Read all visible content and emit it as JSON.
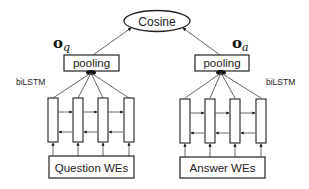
{
  "diagram": {
    "top": {
      "label": "Cosine"
    },
    "question_branch": {
      "output_symbol": "o",
      "output_subscript": "q",
      "pooling_label": "pooling",
      "encoder_label": "biLSTM",
      "input_label": "Question WEs",
      "num_cells": 4
    },
    "answer_branch": {
      "output_symbol": "o",
      "output_subscript": "a",
      "pooling_label": "pooling",
      "encoder_label": "biLSTM",
      "input_label": "Answer WEs",
      "num_cells": 4
    },
    "colors": {
      "stroke": "#222222",
      "edge": "#555555",
      "background": "#ffffff"
    }
  }
}
